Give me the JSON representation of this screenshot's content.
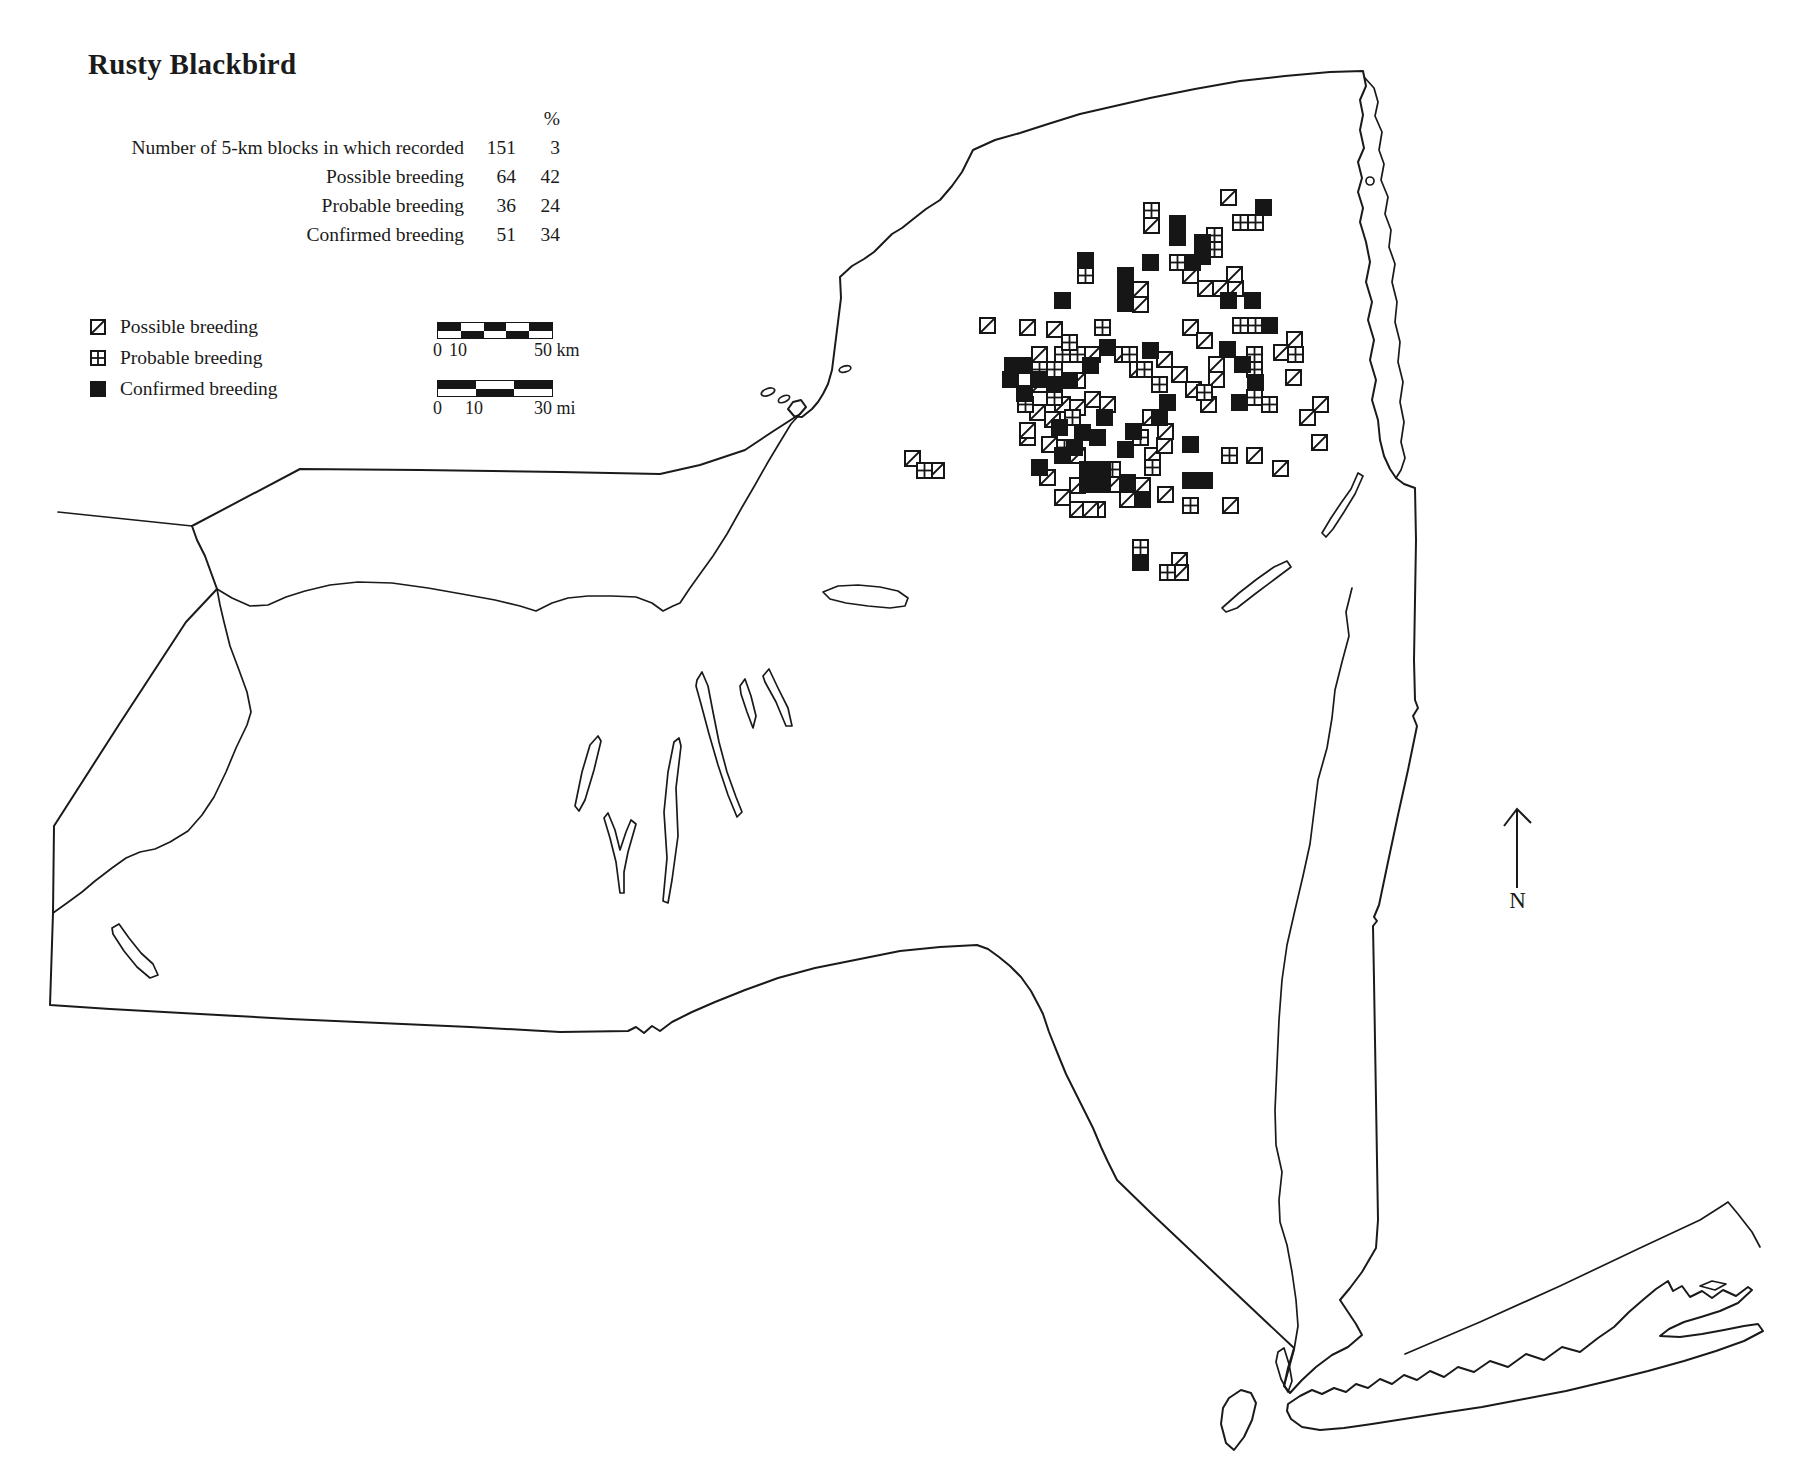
{
  "title": "Rusty Blackbird",
  "stats": {
    "pct_header": "%",
    "rows": [
      {
        "label": "Number of 5-km blocks in which recorded",
        "value": "151",
        "pct": "3"
      },
      {
        "label": "Possible breeding",
        "value": "64",
        "pct": "42"
      },
      {
        "label": "Probable breeding",
        "value": "36",
        "pct": "24"
      },
      {
        "label": "Confirmed breeding",
        "value": "51",
        "pct": "34"
      }
    ]
  },
  "legend": {
    "items": [
      {
        "type": "possible",
        "label": "Possible breeding"
      },
      {
        "type": "probable",
        "label": "Probable breeding"
      },
      {
        "type": "confirmed",
        "label": "Confirmed breeding"
      }
    ]
  },
  "scale_bars": {
    "km": {
      "start": "0",
      "mid": "10",
      "end": "50 km"
    },
    "mi": {
      "start": "0",
      "mid": "10",
      "end": "30 mi"
    }
  },
  "north_arrow": {
    "label": "N"
  },
  "colors": {
    "ink": "#1a1a1a",
    "paper": "#ffffff"
  },
  "chart_data": {
    "type": "map-distribution",
    "region": "New York State",
    "species": "Rusty Blackbird",
    "summary": {
      "total_blocks": 151,
      "total_pct": 3,
      "possible": 64,
      "possible_pct": 42,
      "probable": 36,
      "probable_pct": 24,
      "confirmed": 51,
      "confirmed_pct": 34
    },
    "marker_size_px": 15,
    "markers": [
      {
        "t": "P",
        "x": 1144,
        "y": 218
      },
      {
        "t": "P",
        "x": 1221,
        "y": 190
      },
      {
        "t": "P",
        "x": 980,
        "y": 318
      },
      {
        "t": "P",
        "x": 1020,
        "y": 320
      },
      {
        "t": "P",
        "x": 1183,
        "y": 320
      },
      {
        "t": "P",
        "x": 1197,
        "y": 333
      },
      {
        "t": "P",
        "x": 1183,
        "y": 268
      },
      {
        "t": "P",
        "x": 1198,
        "y": 281
      },
      {
        "t": "P",
        "x": 1213,
        "y": 281
      },
      {
        "t": "P",
        "x": 1228,
        "y": 281
      },
      {
        "t": "P",
        "x": 1227,
        "y": 267
      },
      {
        "t": "P",
        "x": 1133,
        "y": 282
      },
      {
        "t": "P",
        "x": 1133,
        "y": 297
      },
      {
        "t": "P",
        "x": 1209,
        "y": 357
      },
      {
        "t": "P",
        "x": 1209,
        "y": 372
      },
      {
        "t": "P",
        "x": 1287,
        "y": 332
      },
      {
        "t": "P",
        "x": 1274,
        "y": 345
      },
      {
        "t": "P",
        "x": 1286,
        "y": 370
      },
      {
        "t": "P",
        "x": 1313,
        "y": 397
      },
      {
        "t": "P",
        "x": 1300,
        "y": 410
      },
      {
        "t": "P",
        "x": 1312,
        "y": 435
      },
      {
        "t": "P",
        "x": 1247,
        "y": 448
      },
      {
        "t": "P",
        "x": 1273,
        "y": 461
      },
      {
        "t": "P",
        "x": 1223,
        "y": 498
      },
      {
        "t": "P",
        "x": 1158,
        "y": 487
      },
      {
        "t": "P",
        "x": 1120,
        "y": 492
      },
      {
        "t": "P",
        "x": 1090,
        "y": 502
      },
      {
        "t": "P",
        "x": 1105,
        "y": 477
      },
      {
        "t": "P",
        "x": 1135,
        "y": 478
      },
      {
        "t": "P",
        "x": 1090,
        "y": 462
      },
      {
        "t": "P",
        "x": 1145,
        "y": 448
      },
      {
        "t": "P",
        "x": 1157,
        "y": 438
      },
      {
        "t": "P",
        "x": 1020,
        "y": 430
      },
      {
        "t": "P",
        "x": 1042,
        "y": 437
      },
      {
        "t": "P",
        "x": 1070,
        "y": 448
      },
      {
        "t": "P",
        "x": 1070,
        "y": 478
      },
      {
        "t": "P",
        "x": 1070,
        "y": 502
      },
      {
        "t": "P",
        "x": 1083,
        "y": 502
      },
      {
        "t": "P",
        "x": 1172,
        "y": 553
      },
      {
        "t": "P",
        "x": 1173,
        "y": 565
      },
      {
        "t": "P",
        "x": 905,
        "y": 451
      },
      {
        "t": "P",
        "x": 929,
        "y": 463
      },
      {
        "t": "P",
        "x": 1020,
        "y": 423
      },
      {
        "t": "P",
        "x": 1032,
        "y": 347
      },
      {
        "t": "P",
        "x": 1085,
        "y": 347
      },
      {
        "t": "P",
        "x": 1070,
        "y": 373
      },
      {
        "t": "P",
        "x": 1032,
        "y": 377
      },
      {
        "t": "P",
        "x": 1115,
        "y": 347
      },
      {
        "t": "P",
        "x": 1085,
        "y": 392
      },
      {
        "t": "P",
        "x": 1100,
        "y": 397
      },
      {
        "t": "P",
        "x": 1055,
        "y": 397
      },
      {
        "t": "P",
        "x": 1070,
        "y": 400
      },
      {
        "t": "P",
        "x": 1047,
        "y": 322
      },
      {
        "t": "P",
        "x": 1157,
        "y": 352
      },
      {
        "t": "P",
        "x": 1172,
        "y": 367
      },
      {
        "t": "P",
        "x": 1186,
        "y": 382
      },
      {
        "t": "P",
        "x": 1201,
        "y": 397
      },
      {
        "t": "P",
        "x": 1143,
        "y": 410
      },
      {
        "t": "P",
        "x": 1158,
        "y": 424
      },
      {
        "t": "P",
        "x": 1045,
        "y": 412
      },
      {
        "t": "P",
        "x": 1030,
        "y": 405
      },
      {
        "t": "P",
        "x": 1055,
        "y": 490
      },
      {
        "t": "P",
        "x": 1040,
        "y": 470
      },
      {
        "t": "P",
        "x": 1130,
        "y": 362
      },
      {
        "t": "R",
        "x": 1144,
        "y": 203
      },
      {
        "t": "R",
        "x": 1233,
        "y": 215
      },
      {
        "t": "R",
        "x": 1248,
        "y": 215
      },
      {
        "t": "R",
        "x": 1207,
        "y": 228
      },
      {
        "t": "R",
        "x": 1207,
        "y": 242
      },
      {
        "t": "R",
        "x": 1078,
        "y": 268
      },
      {
        "t": "R",
        "x": 1170,
        "y": 255
      },
      {
        "t": "R",
        "x": 1095,
        "y": 320
      },
      {
        "t": "R",
        "x": 1233,
        "y": 318
      },
      {
        "t": "R",
        "x": 1248,
        "y": 318
      },
      {
        "t": "R",
        "x": 1247,
        "y": 347
      },
      {
        "t": "R",
        "x": 1247,
        "y": 362
      },
      {
        "t": "R",
        "x": 1247,
        "y": 390
      },
      {
        "t": "R",
        "x": 1262,
        "y": 397
      },
      {
        "t": "R",
        "x": 1197,
        "y": 385
      },
      {
        "t": "R",
        "x": 1288,
        "y": 347
      },
      {
        "t": "R",
        "x": 1222,
        "y": 448
      },
      {
        "t": "R",
        "x": 1183,
        "y": 498
      },
      {
        "t": "R",
        "x": 1105,
        "y": 462
      },
      {
        "t": "R",
        "x": 1145,
        "y": 460
      },
      {
        "t": "R",
        "x": 1133,
        "y": 430
      },
      {
        "t": "R",
        "x": 1133,
        "y": 540
      },
      {
        "t": "R",
        "x": 1160,
        "y": 565
      },
      {
        "t": "R",
        "x": 917,
        "y": 463
      },
      {
        "t": "R",
        "x": 1018,
        "y": 397
      },
      {
        "t": "R",
        "x": 1055,
        "y": 347
      },
      {
        "t": "R",
        "x": 1070,
        "y": 347
      },
      {
        "t": "R",
        "x": 1032,
        "y": 362
      },
      {
        "t": "R",
        "x": 1047,
        "y": 362
      },
      {
        "t": "R",
        "x": 1057,
        "y": 440
      },
      {
        "t": "R",
        "x": 1047,
        "y": 390
      },
      {
        "t": "R",
        "x": 1062,
        "y": 335
      },
      {
        "t": "R",
        "x": 1122,
        "y": 347
      },
      {
        "t": "R",
        "x": 1137,
        "y": 362
      },
      {
        "t": "R",
        "x": 1152,
        "y": 377
      },
      {
        "t": "R",
        "x": 1065,
        "y": 410
      },
      {
        "t": "C",
        "x": 1170,
        "y": 216
      },
      {
        "t": "C",
        "x": 1170,
        "y": 230
      },
      {
        "t": "C",
        "x": 1256,
        "y": 200
      },
      {
        "t": "C",
        "x": 1195,
        "y": 235
      },
      {
        "t": "C",
        "x": 1195,
        "y": 249
      },
      {
        "t": "C",
        "x": 1078,
        "y": 253
      },
      {
        "t": "C",
        "x": 1143,
        "y": 255
      },
      {
        "t": "C",
        "x": 1185,
        "y": 255
      },
      {
        "t": "C",
        "x": 1055,
        "y": 293
      },
      {
        "t": "C",
        "x": 1118,
        "y": 268
      },
      {
        "t": "C",
        "x": 1118,
        "y": 282
      },
      {
        "t": "C",
        "x": 1118,
        "y": 296
      },
      {
        "t": "C",
        "x": 1143,
        "y": 343
      },
      {
        "t": "C",
        "x": 1221,
        "y": 293
      },
      {
        "t": "C",
        "x": 1245,
        "y": 293
      },
      {
        "t": "C",
        "x": 1262,
        "y": 318
      },
      {
        "t": "C",
        "x": 1220,
        "y": 342
      },
      {
        "t": "C",
        "x": 1235,
        "y": 357
      },
      {
        "t": "C",
        "x": 1248,
        "y": 375
      },
      {
        "t": "C",
        "x": 1232,
        "y": 395
      },
      {
        "t": "C",
        "x": 1017,
        "y": 358
      },
      {
        "t": "C",
        "x": 1003,
        "y": 372
      },
      {
        "t": "C",
        "x": 1031,
        "y": 372
      },
      {
        "t": "C",
        "x": 1017,
        "y": 386
      },
      {
        "t": "C",
        "x": 1032,
        "y": 460
      },
      {
        "t": "C",
        "x": 1080,
        "y": 462
      },
      {
        "t": "C",
        "x": 1095,
        "y": 462
      },
      {
        "t": "C",
        "x": 1080,
        "y": 477
      },
      {
        "t": "C",
        "x": 1095,
        "y": 477
      },
      {
        "t": "C",
        "x": 1118,
        "y": 442
      },
      {
        "t": "C",
        "x": 1183,
        "y": 437
      },
      {
        "t": "C",
        "x": 1183,
        "y": 473
      },
      {
        "t": "C",
        "x": 1197,
        "y": 473
      },
      {
        "t": "C",
        "x": 1135,
        "y": 492
      },
      {
        "t": "C",
        "x": 1120,
        "y": 475
      },
      {
        "t": "C",
        "x": 1090,
        "y": 473
      },
      {
        "t": "C",
        "x": 1133,
        "y": 555
      },
      {
        "t": "C",
        "x": 1055,
        "y": 448
      },
      {
        "t": "C",
        "x": 1083,
        "y": 358
      },
      {
        "t": "C",
        "x": 1062,
        "y": 373
      },
      {
        "t": "C",
        "x": 1047,
        "y": 377
      },
      {
        "t": "C",
        "x": 1097,
        "y": 410
      },
      {
        "t": "C",
        "x": 1126,
        "y": 424
      },
      {
        "t": "C",
        "x": 1090,
        "y": 430
      },
      {
        "t": "C",
        "x": 1152,
        "y": 410
      },
      {
        "t": "C",
        "x": 1160,
        "y": 395
      },
      {
        "t": "C",
        "x": 1067,
        "y": 440
      },
      {
        "t": "C",
        "x": 1052,
        "y": 420
      },
      {
        "t": "C",
        "x": 1075,
        "y": 425
      },
      {
        "t": "C",
        "x": 1005,
        "y": 358
      },
      {
        "t": "C",
        "x": 1100,
        "y": 340
      }
    ]
  }
}
